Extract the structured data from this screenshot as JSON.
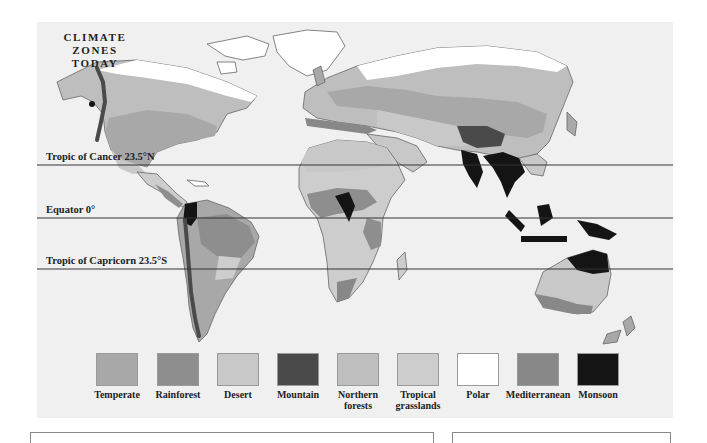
{
  "map": {
    "title_lines": [
      "CLIMATE",
      "ZONES",
      "TODAY"
    ],
    "latitude_lines": [
      {
        "label": "Tropic of Cancer 23.5°N",
        "y": 143
      },
      {
        "label": "Equator 0°",
        "y": 196
      },
      {
        "label": "Tropic of Capricorn 23.5°S",
        "y": 247
      }
    ]
  },
  "legend": {
    "items": [
      {
        "label": "Temperate",
        "label2": "",
        "color": "#a8a8a8"
      },
      {
        "label": "Rainforest",
        "label2": "",
        "color": "#8e8e8e"
      },
      {
        "label": "Desert",
        "label2": "",
        "color": "#c8c8c8"
      },
      {
        "label": "Mountain",
        "label2": "",
        "color": "#4a4a4a"
      },
      {
        "label": "Northern",
        "label2": "forests",
        "color": "#bebebe"
      },
      {
        "label": "Tropical",
        "label2": "grasslands",
        "color": "#cdcdcd"
      },
      {
        "label": "Polar",
        "label2": "",
        "color": "#ffffff"
      },
      {
        "label": "Mediterranean",
        "label2": "",
        "color": "#888888"
      },
      {
        "label": "Monsoon",
        "label2": "",
        "color": "#141414"
      }
    ]
  },
  "colors": {
    "panel_bg": "#f0f0f0",
    "land_outline": "#666666",
    "latitude_line": "#333333"
  }
}
